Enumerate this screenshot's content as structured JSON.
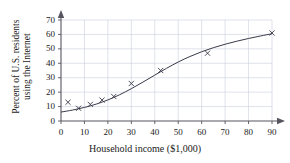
{
  "chart_data": {
    "type": "scatter",
    "title": "",
    "xlabel": "Household income ($1,000)",
    "ylabel_line1": "Percent of U.S. residents",
    "ylabel_line2": "using the Internet",
    "ylabel": "Percent of U.S. residents using the Internet",
    "xlim": [
      0,
      90
    ],
    "ylim": [
      0,
      70
    ],
    "xticks": [
      0,
      10,
      20,
      30,
      40,
      50,
      60,
      70,
      80,
      90
    ],
    "yticks": [
      0,
      10,
      20,
      30,
      40,
      50,
      60,
      70
    ],
    "grid": true,
    "legend": "none",
    "marker": "x",
    "marker_color": "#3a3a4a",
    "curve_color": "#3a3a4a",
    "grid_color": "#c9cfdd",
    "axis_color": "#55555f",
    "points": [
      {
        "x": 3.0,
        "y": 13.0
      },
      {
        "x": 7.5,
        "y": 8.8
      },
      {
        "x": 12.5,
        "y": 11.5
      },
      {
        "x": 17.5,
        "y": 14.5
      },
      {
        "x": 22.5,
        "y": 17.0
      },
      {
        "x": 30.0,
        "y": 26.0
      },
      {
        "x": 42.5,
        "y": 35.0
      },
      {
        "x": 62.5,
        "y": 47.0
      },
      {
        "x": 90.0,
        "y": 61.0
      }
    ],
    "fit_curve": [
      {
        "x": 0,
        "y": 6.2
      },
      {
        "x": 5,
        "y": 7.6
      },
      {
        "x": 10,
        "y": 9.4
      },
      {
        "x": 15,
        "y": 11.7
      },
      {
        "x": 20,
        "y": 14.6
      },
      {
        "x": 25,
        "y": 18.2
      },
      {
        "x": 30,
        "y": 22.4
      },
      {
        "x": 35,
        "y": 27.0
      },
      {
        "x": 40,
        "y": 31.8
      },
      {
        "x": 45,
        "y": 36.5
      },
      {
        "x": 50,
        "y": 40.9
      },
      {
        "x": 55,
        "y": 44.7
      },
      {
        "x": 60,
        "y": 48.0
      },
      {
        "x": 65,
        "y": 50.8
      },
      {
        "x": 70,
        "y": 53.2
      },
      {
        "x": 75,
        "y": 55.3
      },
      {
        "x": 80,
        "y": 57.2
      },
      {
        "x": 85,
        "y": 58.9
      },
      {
        "x": 90,
        "y": 60.5
      }
    ]
  }
}
